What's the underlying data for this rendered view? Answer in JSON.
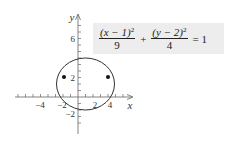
{
  "equation": {
    "term1_numerator_base": "(x − 1)",
    "term1_exponent": "2",
    "term1_denominator": "9",
    "operator": "+",
    "term2_numerator_base": "(y − 2)",
    "term2_exponent": "2",
    "term2_denominator": "4",
    "equals": "= 1"
  },
  "axes": {
    "x_label": "x",
    "y_label": "y",
    "x_tick_labels": [
      "−4",
      "−2",
      "2",
      "4"
    ],
    "y_tick_labels": [
      "6",
      "2",
      "−2"
    ]
  },
  "ellipse": {
    "center": [
      1,
      2
    ],
    "semi_major_horizontal": 3,
    "semi_minor_vertical": 2,
    "foci": [
      [
        -1.24,
        2
      ],
      [
        3.24,
        2
      ]
    ]
  },
  "colors": {
    "curve": "#333333",
    "axis": "#555555",
    "equation_box": "#ededed"
  }
}
